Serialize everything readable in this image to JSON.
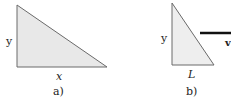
{
  "figure_a": {
    "label_vertical": "y",
    "label_horizontal": "x",
    "caption": "a)"
  },
  "figure_b": {
    "label_vertical": "y",
    "label_horizontal": "L",
    "label_line": "v",
    "caption": "b)"
  },
  "colors": {
    "fill": "#e8e8e8",
    "stroke": "#6a6a6a",
    "thick_line": "#111111"
  }
}
